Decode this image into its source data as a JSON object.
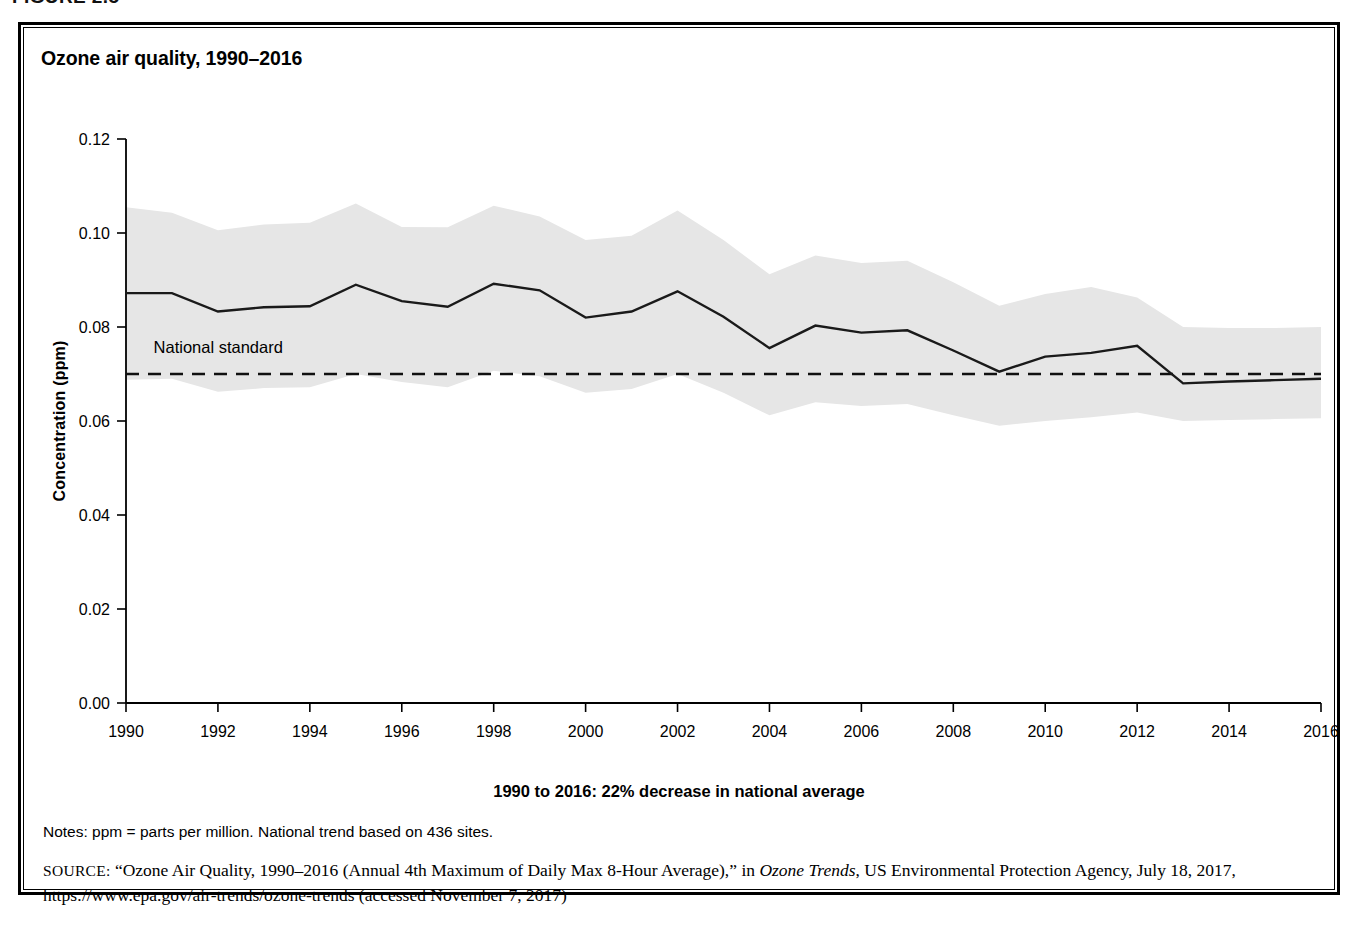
{
  "figure": {
    "caption": "FIGURE 2.5",
    "title": "Ozone air quality, 1990–2016",
    "x_subtitle": "1990 to 2016: 22% decrease in national average",
    "notes": "Notes: ppm = parts per million. National trend based on 436 sites.",
    "source_label": "SOURCE:",
    "source_part1": " “Ozone Air Quality, 1990–2016 (Annual 4th Maximum of Daily Max 8-Hour Average),” in ",
    "source_italic": "Ozone Trends",
    "source_part2": ", US Environmental Protection Agency, July 18, 2017, https://www.epa.gov/air-trends/ozone-trends (accessed November 7, 2017)"
  },
  "chart_data": {
    "type": "line",
    "title": "Ozone air quality, 1990–2016",
    "xlabel": "1990 to 2016: 22% decrease in national average",
    "ylabel": "Concentration (ppm)",
    "xlim": [
      1990,
      2016
    ],
    "ylim": [
      0.0,
      0.12
    ],
    "grid": false,
    "legend": "none",
    "annotations": [
      {
        "text": "National standard",
        "x": 1990.6,
        "y": 0.0745
      }
    ],
    "x": [
      1990,
      1991,
      1992,
      1993,
      1994,
      1995,
      1996,
      1997,
      1998,
      1999,
      2000,
      2001,
      2002,
      2003,
      2004,
      2005,
      2006,
      2007,
      2008,
      2009,
      2010,
      2011,
      2012,
      2013,
      2014,
      2015,
      2016
    ],
    "xticks": [
      1990,
      1992,
      1994,
      1996,
      1998,
      2000,
      2002,
      2004,
      2006,
      2008,
      2010,
      2012,
      2014,
      2016
    ],
    "yticks": [
      0.0,
      0.02,
      0.04,
      0.06,
      0.08,
      0.1,
      0.12
    ],
    "ytick_labels": [
      "0.00",
      "0.02",
      "0.04",
      "0.06",
      "0.08",
      "0.10",
      "0.12"
    ],
    "series": [
      {
        "name": "National average (annual 4th max of daily max 8-hour average)",
        "style": "solid",
        "values": [
          0.0872,
          0.0872,
          0.0833,
          0.0842,
          0.0844,
          0.089,
          0.0855,
          0.0843,
          0.0892,
          0.0878,
          0.082,
          0.0833,
          0.0876,
          0.0822,
          0.0755,
          0.0803,
          0.0788,
          0.0793,
          0.075,
          0.0705,
          0.0737,
          0.0745,
          0.076,
          0.068,
          0.0684,
          0.0687,
          0.069
        ]
      },
      {
        "name": "National standard",
        "style": "dashed",
        "constant": 0.07
      }
    ],
    "band": {
      "name": "10th–90th percentile range",
      "fill": "#e6e6e6",
      "upper": [
        0.1055,
        0.1043,
        0.1006,
        0.1018,
        0.1022,
        0.1063,
        0.1013,
        0.1012,
        0.1058,
        0.1035,
        0.0985,
        0.0994,
        0.1048,
        0.0985,
        0.0912,
        0.0952,
        0.0936,
        0.0941,
        0.0895,
        0.0845,
        0.087,
        0.0885,
        0.0863,
        0.08,
        0.0798,
        0.0798,
        0.08
      ],
      "lower": [
        0.0688,
        0.069,
        0.0662,
        0.067,
        0.0672,
        0.07,
        0.0683,
        0.0672,
        0.0707,
        0.0695,
        0.066,
        0.0668,
        0.07,
        0.066,
        0.0612,
        0.064,
        0.0632,
        0.0636,
        0.0612,
        0.059,
        0.06,
        0.0608,
        0.0618,
        0.06,
        0.0602,
        0.0604,
        0.0606
      ]
    },
    "colors": {
      "line": "#1a1a1a",
      "band": "#e6e6e6",
      "standard": "#111111"
    }
  }
}
